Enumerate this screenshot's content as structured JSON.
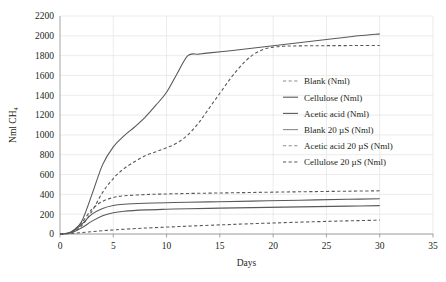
{
  "chart_data": {
    "type": "line",
    "title": "",
    "xlabel": "Days",
    "ylabel": "Nml CH₄",
    "xlim": [
      0,
      35
    ],
    "ylim": [
      0,
      2200
    ],
    "xticks": [
      0,
      5,
      10,
      15,
      20,
      25,
      30,
      35
    ],
    "yticks": [
      0,
      200,
      400,
      600,
      800,
      1000,
      1200,
      1400,
      1600,
      1800,
      2000,
      2200
    ],
    "grid": true,
    "legend_position": "center-right",
    "series": [
      {
        "name": "Blank (Nml)",
        "style": "dashed",
        "color": "#8c8c8c",
        "x": [
          0,
          1,
          2,
          3,
          4,
          5,
          6,
          8,
          10,
          12,
          14,
          16,
          18,
          20,
          22,
          24,
          26,
          28,
          30
        ],
        "y": [
          0,
          5,
          14,
          24,
          33,
          41,
          48,
          60,
          70,
          79,
          88,
          96,
          104,
          111,
          118,
          124,
          130,
          135,
          140
        ]
      },
      {
        "name": "Cellulose (Nml)",
        "style": "solid",
        "color": "#595959",
        "x": [
          0,
          1,
          2,
          3,
          4,
          5,
          6,
          7,
          8,
          9,
          10,
          11,
          12,
          13,
          14,
          16,
          18,
          20,
          22,
          24,
          26,
          28,
          30
        ],
        "y": [
          0,
          20,
          120,
          400,
          700,
          880,
          990,
          1080,
          1180,
          1300,
          1430,
          1620,
          1800,
          1815,
          1828,
          1850,
          1875,
          1900,
          1925,
          1950,
          1975,
          2000,
          2020
        ]
      },
      {
        "name": "Acetic acid (Nml)",
        "style": "solid",
        "color": "#595959",
        "x": [
          0,
          1,
          2,
          3,
          4,
          5,
          6,
          8,
          10,
          12,
          15,
          18,
          21,
          24,
          27,
          30
        ],
        "y": [
          0,
          15,
          95,
          200,
          258,
          288,
          300,
          310,
          316,
          320,
          326,
          332,
          338,
          344,
          350,
          356
        ]
      },
      {
        "name": "Blank 20 µS (Nml)",
        "style": "solid",
        "color": "#8c8c8c",
        "x": [
          0,
          1,
          2,
          3,
          4,
          5,
          6,
          8,
          10,
          12,
          15,
          18,
          21,
          24,
          27,
          30
        ],
        "y": [
          0,
          10,
          60,
          130,
          185,
          215,
          230,
          243,
          250,
          255,
          261,
          266,
          271,
          276,
          281,
          286
        ]
      },
      {
        "name": "Acetic acid 20 µS (Nml)",
        "style": "dashed",
        "color": "#8c8c8c",
        "x": [
          0,
          1,
          2,
          3,
          4,
          5,
          6,
          8,
          10,
          12,
          15,
          18,
          21,
          24,
          27,
          30
        ],
        "y": [
          0,
          18,
          110,
          250,
          330,
          368,
          385,
          398,
          404,
          409,
          414,
          419,
          424,
          428,
          432,
          436
        ]
      },
      {
        "name": "Cellulose 20 µS (Nml)",
        "style": "dashed",
        "color": "#595959",
        "x": [
          0,
          1,
          2,
          3,
          4,
          5,
          6,
          7,
          8,
          9,
          10,
          11,
          12,
          13,
          14,
          15,
          16,
          17,
          18,
          19,
          20,
          21,
          22,
          24,
          26,
          28,
          30
        ],
        "y": [
          0,
          12,
          80,
          230,
          420,
          560,
          660,
          730,
          790,
          830,
          870,
          920,
          1000,
          1120,
          1270,
          1420,
          1570,
          1700,
          1800,
          1860,
          1885,
          1895,
          1898,
          1900,
          1901,
          1902,
          1903
        ]
      }
    ]
  },
  "legend": {
    "items": [
      {
        "label": "Blank (Nml)",
        "style": "dashed",
        "color": "#8c8c8c"
      },
      {
        "label": "Cellulose (Nml)",
        "style": "solid",
        "color": "#595959"
      },
      {
        "label": "Acetic acid (Nml)",
        "style": "solid",
        "color": "#595959"
      },
      {
        "label": "Blank 20 µS (Nml)",
        "style": "solid",
        "color": "#8c8c8c"
      },
      {
        "label": "Acetic acid 20 µS (Nml)",
        "style": "dashed",
        "color": "#8c8c8c"
      },
      {
        "label": "Cellulose 20 µS (Nml)",
        "style": "dashed",
        "color": "#595959"
      }
    ]
  }
}
